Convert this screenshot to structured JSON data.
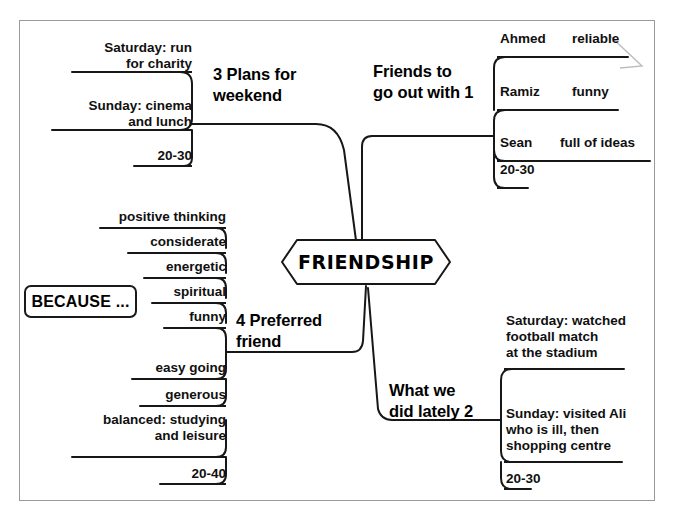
{
  "diagram": {
    "title": "FRIENDSHIP",
    "center_label": "FRIENDSHIP",
    "because_label": "BECAUSE ...",
    "ink_color": "#111111",
    "sheet_border_color": "#9a9a9a",
    "background": "#ffffff",
    "branches": [
      {
        "id": "plans-for-weekend",
        "label": "3 Plans for\nweekend",
        "number": "3",
        "side": "top-left",
        "items": [
          {
            "text": "Saturday: run\nfor charity"
          },
          {
            "text": "Sunday: cinema\nand lunch"
          },
          {
            "text": "20-30"
          }
        ]
      },
      {
        "id": "friends-to-go-out-with",
        "label": "Friends to\ngo out with 1",
        "number": "1",
        "side": "top-right",
        "items": [
          {
            "name": "Ahmed",
            "trait": "reliable"
          },
          {
            "name": "Ramiz",
            "trait": "funny"
          },
          {
            "name": "Sean",
            "trait": "full of ideas"
          },
          {
            "name": "20-30",
            "trait": ""
          }
        ]
      },
      {
        "id": "preferred-friend",
        "label": "4 Preferred\nfriend",
        "number": "4",
        "side": "bottom-left",
        "items": [
          {
            "text": "positive thinking"
          },
          {
            "text": "considerate"
          },
          {
            "text": "energetic"
          },
          {
            "text": "spiritual"
          },
          {
            "text": "funny"
          },
          {
            "text": "easy going"
          },
          {
            "text": "generous"
          },
          {
            "text": "balanced: studying\nand leisure"
          },
          {
            "text": "20-40"
          }
        ]
      },
      {
        "id": "what-we-did-lately",
        "label": "What we\ndid lately 2",
        "number": "2",
        "side": "bottom-right",
        "items": [
          {
            "text": "Saturday: watched\nfootball match\nat the stadium"
          },
          {
            "text": "Sunday: visited Ali\nwho is ill, then\nshopping centre"
          },
          {
            "text": "20-30"
          }
        ]
      }
    ]
  }
}
